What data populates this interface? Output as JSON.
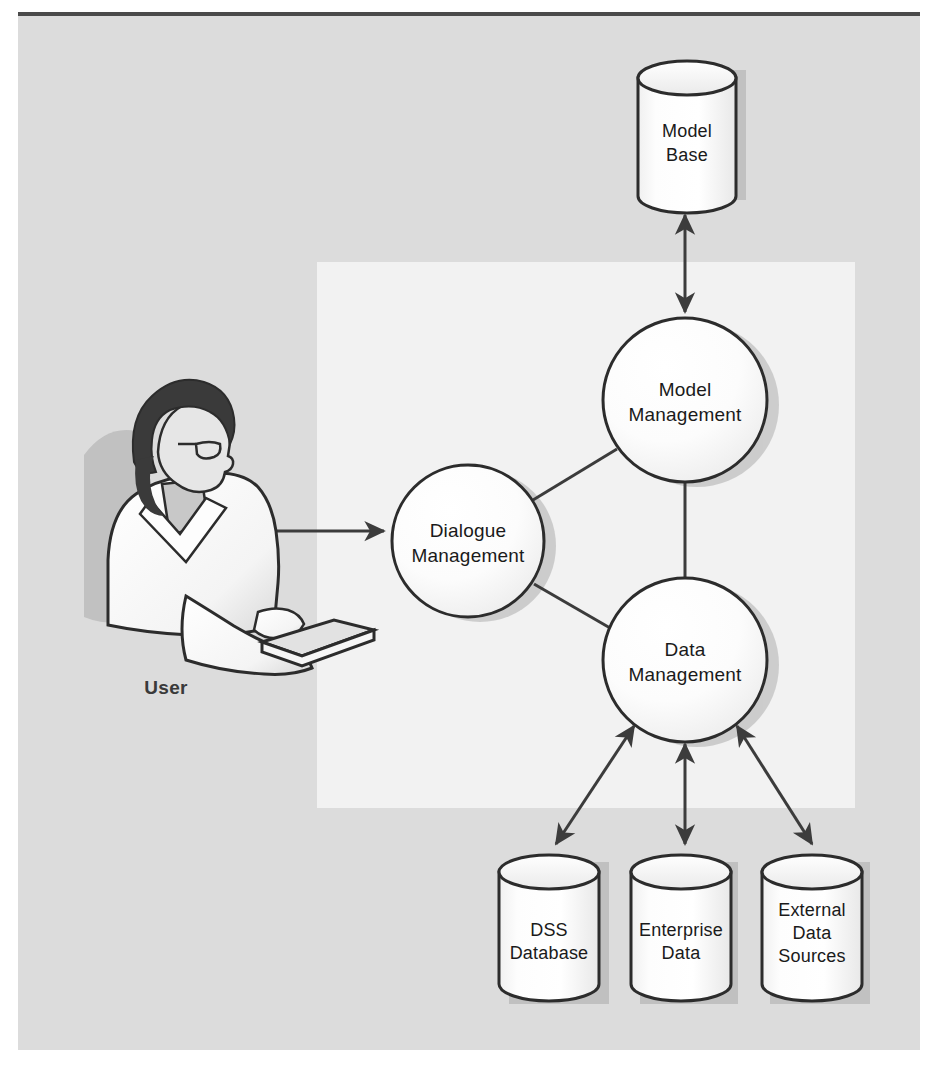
{
  "figure": {
    "background_color": "#dcdcdc",
    "inner_panel_color": "#f2f2f2",
    "page_color": "#ffffff",
    "line_color": "#3c3c3c",
    "shape_fill": "#fbfbfb",
    "shadow_color": "#b5b5b5"
  },
  "actor": {
    "label": "User",
    "icon": "person-at-keyboard-icon"
  },
  "components": [
    {
      "id": "dialogue",
      "line1": "Dialogue",
      "line2": "Management",
      "shape": "circle"
    },
    {
      "id": "model_mgmt",
      "line1": "Model",
      "line2": "Management",
      "shape": "circle"
    },
    {
      "id": "data_mgmt",
      "line1": "Data",
      "line2": "Management",
      "shape": "circle"
    }
  ],
  "stores": [
    {
      "id": "model_base",
      "line1": "Model",
      "line2": "Base",
      "line3": "",
      "shape": "cylinder"
    },
    {
      "id": "dss_db",
      "line1": "DSS",
      "line2": "Database",
      "line3": "",
      "shape": "cylinder"
    },
    {
      "id": "enterprise_data",
      "line1": "Enterprise",
      "line2": "Data",
      "line3": "",
      "shape": "cylinder"
    },
    {
      "id": "external_sources",
      "line1": "External",
      "line2": "Data",
      "line3": "Sources",
      "shape": "cylinder"
    }
  ],
  "connectors": [
    {
      "from": "user",
      "to": "dialogue",
      "style": "double-arrow"
    },
    {
      "from": "dialogue",
      "to": "model_mgmt",
      "style": "line"
    },
    {
      "from": "dialogue",
      "to": "data_mgmt",
      "style": "line"
    },
    {
      "from": "model_mgmt",
      "to": "data_mgmt",
      "style": "line"
    },
    {
      "from": "model_mgmt",
      "to": "model_base",
      "style": "double-arrow"
    },
    {
      "from": "data_mgmt",
      "to": "dss_db",
      "style": "double-arrow"
    },
    {
      "from": "data_mgmt",
      "to": "enterprise_data",
      "style": "double-arrow"
    },
    {
      "from": "data_mgmt",
      "to": "external_sources",
      "style": "double-arrow"
    }
  ]
}
